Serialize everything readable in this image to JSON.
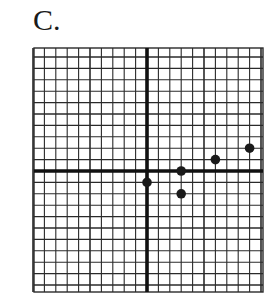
{
  "figure": {
    "label": "C."
  },
  "chart_data": {
    "type": "scatter",
    "title": "C.",
    "xlabel": "",
    "ylabel": "",
    "grid": true,
    "xlim": [
      -10,
      10
    ],
    "ylim": [
      -11,
      11
    ],
    "points": [
      {
        "x": 0,
        "y": -1
      },
      {
        "x": 3,
        "y": 0
      },
      {
        "x": 3,
        "y": -2
      },
      {
        "x": 6,
        "y": 1
      },
      {
        "x": 9,
        "y": 2
      }
    ],
    "x": [
      0,
      3,
      3,
      6,
      9
    ],
    "y": [
      -1,
      0,
      -2,
      1,
      2
    ]
  },
  "style": {
    "grid_color": "#2a2a2a",
    "axis_color": "#111111",
    "point_color": "#1a1a1a",
    "origin_px": [
      147,
      171
    ],
    "cell_px": 11.4,
    "grid_px": {
      "left": 34,
      "right": 263,
      "top": 48,
      "bottom": 292
    }
  }
}
